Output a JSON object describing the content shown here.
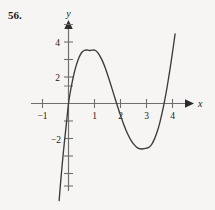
{
  "exercise": {
    "number": "56."
  },
  "axes": {
    "x_label": "x",
    "y_label": "y",
    "x_ticks_labeled": [
      {
        "value": -1,
        "text": "−1"
      },
      {
        "value": 1,
        "text": "1"
      },
      {
        "value": 2,
        "text": "2"
      },
      {
        "value": 3,
        "text": "3"
      },
      {
        "value": 4,
        "text": "4"
      }
    ],
    "y_ticks_labeled": [
      {
        "value": 4,
        "text": "4"
      },
      {
        "value": 2,
        "text": "2"
      },
      {
        "value": -2,
        "text": "−2"
      }
    ],
    "x_minor_ticks": [
      -1,
      1,
      2,
      3,
      4
    ],
    "y_minor_ticks": [
      5,
      4,
      3,
      2,
      1,
      -1,
      -2,
      -3,
      -4,
      -5,
      -6
    ],
    "xlim": [
      -1.7,
      4.7
    ],
    "ylim": [
      -6.6,
      5.4
    ],
    "grid": false,
    "arrow_x": true,
    "arrow_y": true
  },
  "chart_data": {
    "type": "line",
    "title": "",
    "xlabel": "x",
    "ylabel": "y",
    "xlim": [
      -1.7,
      4.7
    ],
    "ylim": [
      -6.6,
      5.4
    ],
    "grid": false,
    "legend": "none",
    "annotations": [],
    "series": [
      {
        "name": "curve",
        "color": "#3b3b3b",
        "roots": [
          0.0,
          2.05,
          3.87
        ],
        "local_max": {
          "x": 1.03,
          "y": 3.05
        },
        "local_min": {
          "x": 3.08,
          "y": -2.6
        },
        "x": [
          -0.36,
          -0.3,
          -0.24,
          -0.18,
          -0.12,
          -0.06,
          0.0,
          0.1,
          0.2,
          0.3,
          0.4,
          0.5,
          0.6,
          0.7,
          0.8,
          0.9,
          1.0,
          1.1,
          1.2,
          1.3,
          1.4,
          1.5,
          1.6,
          1.7,
          1.8,
          1.9,
          2.0,
          2.1,
          2.2,
          2.3,
          2.4,
          2.5,
          2.6,
          2.7,
          2.8,
          2.9,
          3.0,
          3.1,
          3.2,
          3.3,
          3.4,
          3.5,
          3.6,
          3.7,
          3.8,
          3.9,
          4.0,
          4.1
        ],
        "y": [
          -5.55,
          -4.45,
          -3.45,
          -2.53,
          -1.68,
          -0.85,
          0.0,
          0.9,
          1.62,
          2.19,
          2.62,
          2.9,
          3.03,
          3.06,
          3.03,
          3.05,
          3.05,
          2.95,
          2.74,
          2.45,
          2.08,
          1.66,
          1.2,
          0.72,
          0.24,
          -0.23,
          -0.68,
          -1.1,
          -1.48,
          -1.81,
          -2.09,
          -2.31,
          -2.47,
          -2.57,
          -2.6,
          -2.58,
          -2.55,
          -2.5,
          -2.33,
          -2.05,
          -1.66,
          -1.16,
          -0.54,
          0.18,
          1.0,
          1.92,
          2.92,
          3.98
        ]
      }
    ]
  },
  "colors": {
    "background": "#f6f5f3",
    "axis": "#6f6f6f",
    "curve": "#3b3b3b",
    "text": "#1a1a1a"
  }
}
